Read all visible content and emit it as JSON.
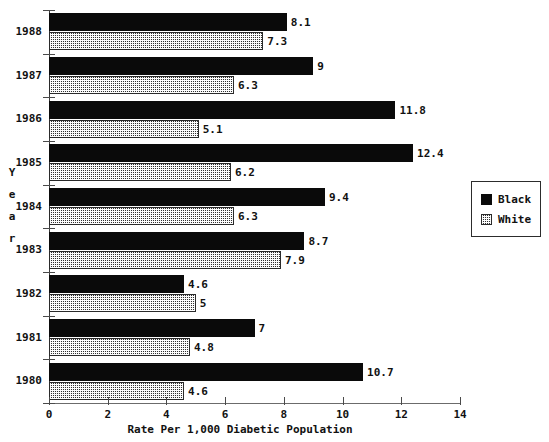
{
  "chart_data": {
    "type": "bar",
    "orientation": "horizontal",
    "title": "",
    "xlabel": "Rate Per 1,000 Diabetic Population",
    "ylabel": "Year",
    "ylabel_stacked": [
      "Y",
      "e",
      "a",
      "r"
    ],
    "categories": [
      "1988",
      "1987",
      "1986",
      "1985",
      "1984",
      "1983",
      "1982",
      "1981",
      "1980"
    ],
    "series": [
      {
        "name": "Black",
        "color": "#0a0a0a",
        "pattern": "solid",
        "values": [
          8.1,
          9,
          11.8,
          12.4,
          9.4,
          8.7,
          4.6,
          7,
          10.7
        ],
        "labels": [
          "8.1",
          "9",
          "11.8",
          "12.4",
          "9.4",
          "8.7",
          "4.6",
          "7",
          "10.7"
        ]
      },
      {
        "name": "White",
        "color": "#cfcfcf",
        "pattern": "stipple",
        "values": [
          7.3,
          6.3,
          5.1,
          6.2,
          6.3,
          7.9,
          5,
          4.8,
          4.6
        ],
        "labels": [
          "7.3",
          "6.3",
          "5.1",
          "6.2",
          "6.3",
          "7.9",
          "5",
          "4.8",
          "4.6"
        ]
      }
    ],
    "xlim": [
      0,
      14
    ],
    "xticks": [
      0,
      2,
      4,
      6,
      8,
      10,
      12,
      14
    ],
    "xticklabels": [
      "0",
      "2",
      "4",
      "6",
      "8",
      "10",
      "12",
      "14"
    ],
    "grid": false,
    "legend": {
      "position": "right",
      "entries": [
        {
          "label": "Black",
          "swatch": "solid-black-swatch"
        },
        {
          "label": "White",
          "swatch": "stippled-white-swatch"
        }
      ]
    }
  }
}
